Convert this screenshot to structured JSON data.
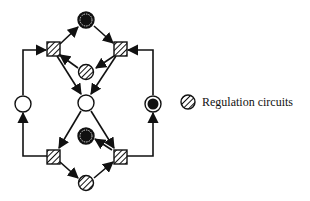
{
  "diagram": {
    "type": "regulatory-network",
    "legend": {
      "items": [
        {
          "symbol": "hatched-circle",
          "label": "Regulation circuits"
        }
      ]
    },
    "nodes": [
      {
        "id": "top-node",
        "shape": "circle",
        "fill": "black-ring"
      },
      {
        "id": "top-left-rect",
        "shape": "rect",
        "fill": "hatched"
      },
      {
        "id": "top-right-rect",
        "shape": "rect",
        "fill": "hatched"
      },
      {
        "id": "top-regulation",
        "shape": "circle",
        "fill": "hatched"
      },
      {
        "id": "left-node",
        "shape": "circle",
        "fill": "white"
      },
      {
        "id": "center-node",
        "shape": "circle",
        "fill": "white"
      },
      {
        "id": "right-node",
        "shape": "circle",
        "fill": "black-ring"
      },
      {
        "id": "bottom-node-upper",
        "shape": "circle",
        "fill": "black-ring"
      },
      {
        "id": "bottom-left-rect",
        "shape": "rect",
        "fill": "hatched"
      },
      {
        "id": "bottom-right-rect",
        "shape": "rect",
        "fill": "hatched"
      },
      {
        "id": "bottom-regulation",
        "shape": "circle",
        "fill": "hatched"
      }
    ],
    "colors": {
      "stroke": "#111111",
      "fill_dark": "#111111",
      "background": "#ffffff"
    }
  }
}
